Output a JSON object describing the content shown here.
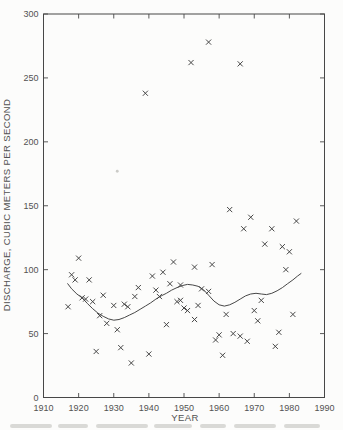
{
  "figure": {
    "paper_color": "#fcfcfb",
    "ink_color": "#474747",
    "text_color": "#525252",
    "marker_glyph": "x-cross",
    "bottom_edge": "cropped-caption-remnant"
  },
  "chart_data": {
    "type": "scatter",
    "title": "",
    "xlabel": "YEAR",
    "ylabel": "DISCHARGE, CUBIC METERS PER SECOND",
    "xlim": [
      1910,
      1990
    ],
    "ylim": [
      0,
      300
    ],
    "x_ticks": [
      1910,
      1920,
      1930,
      1940,
      1950,
      1960,
      1970,
      1980,
      1990
    ],
    "y_ticks": [
      0,
      50,
      100,
      150,
      200,
      250,
      300
    ],
    "grid": false,
    "legend": "none",
    "frame": "full-box-with-inward-ticks",
    "points": [
      [
        1917,
        71
      ],
      [
        1918,
        96
      ],
      [
        1919,
        92
      ],
      [
        1920,
        109
      ],
      [
        1921,
        78
      ],
      [
        1922,
        77
      ],
      [
        1923,
        92
      ],
      [
        1924,
        75
      ],
      [
        1925,
        36
      ],
      [
        1926,
        64
      ],
      [
        1927,
        80
      ],
      [
        1928,
        58
      ],
      [
        1930,
        72
      ],
      [
        1931,
        53
      ],
      [
        1932,
        39
      ],
      [
        1933,
        73
      ],
      [
        1934,
        71
      ],
      [
        1935,
        27
      ],
      [
        1936,
        79
      ],
      [
        1937,
        86
      ],
      [
        1939,
        238
      ],
      [
        1940,
        34
      ],
      [
        1941,
        95
      ],
      [
        1942,
        84
      ],
      [
        1943,
        79
      ],
      [
        1944,
        98
      ],
      [
        1945,
        57
      ],
      [
        1946,
        89
      ],
      [
        1947,
        106
      ],
      [
        1948,
        75
      ],
      [
        1949,
        88
      ],
      [
        1949,
        76
      ],
      [
        1950,
        70
      ],
      [
        1951,
        68
      ],
      [
        1952,
        262
      ],
      [
        1953,
        102
      ],
      [
        1953,
        61
      ],
      [
        1954,
        72
      ],
      [
        1955,
        85
      ],
      [
        1957,
        278
      ],
      [
        1957,
        83
      ],
      [
        1958,
        104
      ],
      [
        1959,
        45
      ],
      [
        1960,
        49
      ],
      [
        1961,
        33
      ],
      [
        1962,
        65
      ],
      [
        1963,
        147
      ],
      [
        1964,
        50
      ],
      [
        1966,
        261
      ],
      [
        1966,
        48
      ],
      [
        1967,
        132
      ],
      [
        1968,
        44
      ],
      [
        1969,
        141
      ],
      [
        1970,
        68
      ],
      [
        1971,
        60
      ],
      [
        1972,
        76
      ],
      [
        1973,
        120
      ],
      [
        1975,
        132
      ],
      [
        1976,
        40
      ],
      [
        1977,
        51
      ],
      [
        1978,
        118
      ],
      [
        1979,
        100
      ],
      [
        1980,
        114
      ],
      [
        1981,
        65
      ],
      [
        1982,
        138
      ]
    ],
    "faint_point": [
      1931,
      177
    ],
    "smooth_line": [
      [
        1916.9,
        89
      ],
      [
        1918,
        85
      ],
      [
        1919.5,
        81
      ],
      [
        1921,
        78
      ],
      [
        1922.5,
        73.5
      ],
      [
        1924,
        69.5
      ],
      [
        1925.5,
        66
      ],
      [
        1927,
        63.5
      ],
      [
        1928.5,
        61.5
      ],
      [
        1930,
        60.5
      ],
      [
        1931.5,
        61
      ],
      [
        1933,
        62.5
      ],
      [
        1934.5,
        64.5
      ],
      [
        1936,
        66.5
      ],
      [
        1937.5,
        69
      ],
      [
        1939,
        71.5
      ],
      [
        1940.5,
        74
      ],
      [
        1942,
        77
      ],
      [
        1943.5,
        79.5
      ],
      [
        1945,
        81.5
      ],
      [
        1946.5,
        84
      ],
      [
        1948,
        86
      ],
      [
        1949.5,
        87.5
      ],
      [
        1951,
        88.5
      ],
      [
        1952.5,
        88
      ],
      [
        1954,
        87
      ],
      [
        1955.5,
        84.5
      ],
      [
        1957,
        80
      ],
      [
        1958.5,
        75.5
      ],
      [
        1960,
        72.5
      ],
      [
        1961.5,
        71.5
      ],
      [
        1963,
        72.5
      ],
      [
        1964.5,
        74.5
      ],
      [
        1966,
        77
      ],
      [
        1967.5,
        79.5
      ],
      [
        1969,
        81
      ],
      [
        1970.5,
        81.5
      ],
      [
        1972,
        81
      ],
      [
        1973.5,
        80.5
      ],
      [
        1975,
        81.5
      ],
      [
        1976.5,
        83.5
      ],
      [
        1978,
        86
      ],
      [
        1979.5,
        89
      ],
      [
        1981,
        92
      ],
      [
        1982.3,
        95
      ],
      [
        1983.3,
        97
      ]
    ]
  }
}
